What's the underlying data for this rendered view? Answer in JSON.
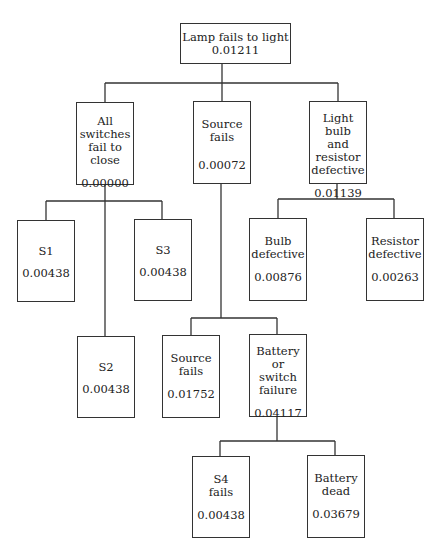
{
  "diagram": {
    "type": "fault-tree",
    "nodes": {
      "root": {
        "label": "Lamp fails to light",
        "value": "0.01211"
      },
      "all_switches": {
        "label": "All\nswitches\nfail to close",
        "value": "0.00000"
      },
      "source_fails_1": {
        "label": "Source\nfails",
        "value": "0.00072"
      },
      "bulb_resistor": {
        "label": "Light bulb\nand resistor\ndefective",
        "value": "0.01139"
      },
      "s1": {
        "label": "S1",
        "value": "0.00438"
      },
      "s2": {
        "label": "S2",
        "value": "0.00438"
      },
      "s3": {
        "label": "S3",
        "value": "0.00438"
      },
      "bulb_defective": {
        "label": "Bulb\ndefective",
        "value": "0.00876"
      },
      "resistor_defective": {
        "label": "Resistor\ndefective",
        "value": "0.00263"
      },
      "source_fails_2": {
        "label": "Source\nfails",
        "value": "0.01752"
      },
      "battery_switch": {
        "label": "Battery or\nswitch\nfailure",
        "value": "0.04117"
      },
      "s4_fails": {
        "label": "S4\nfails",
        "value": "0.00438"
      },
      "battery_dead": {
        "label": "Battery\ndead",
        "value": "0.03679"
      }
    },
    "line_color": "#333333"
  }
}
